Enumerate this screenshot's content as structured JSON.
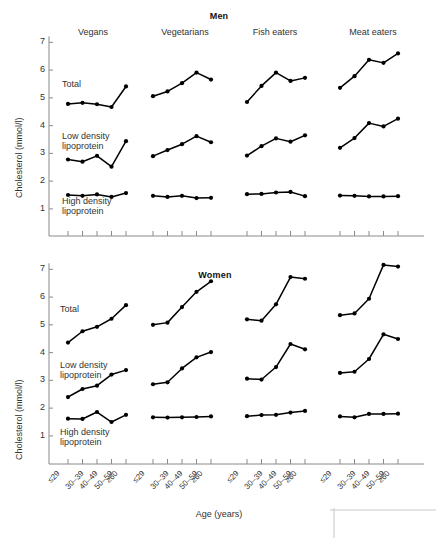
{
  "figure": {
    "ylabel": "Cholesterol (mmol/l)",
    "xlabel": "Age (years)",
    "ytick_labels": [
      "1",
      "2",
      "3",
      "4",
      "5",
      "6",
      "7"
    ],
    "age_groups": [
      "≤29",
      "30–39",
      "40–49",
      "50–59",
      "≥60"
    ],
    "diet_groups": [
      "Vegans",
      "Vegetarians",
      "Fish eaters",
      "Meat eaters"
    ],
    "series_labels": {
      "total": "Total",
      "ldl": "Low density\nlipoprotein",
      "ldl_line1": "Low density",
      "ldl_line2": "lipoprotein",
      "hdl_line1": "High density",
      "hdl_line2": "lipoprotein"
    },
    "panels": [
      "Men",
      "Women"
    ]
  },
  "chart_data": [
    {
      "type": "line",
      "title": "Men",
      "xlabel": "Age (years)",
      "ylabel": "Cholesterol (mmol/l)",
      "ylim": [
        0.6,
        7.3
      ],
      "yticks": [
        1,
        2,
        3,
        4,
        5,
        6,
        7
      ],
      "grid": false,
      "legend": "inline-labels",
      "categories": [
        "≤29",
        "30–39",
        "40–49",
        "50–59",
        "≥60"
      ],
      "groups": [
        {
          "name": "Vegans",
          "series": [
            {
              "name": "Total",
              "values": [
                4.78,
                4.82,
                4.77,
                4.67,
                5.41
              ]
            },
            {
              "name": "Low density lipoprotein",
              "values": [
                2.78,
                2.7,
                2.91,
                2.52,
                3.44
              ]
            },
            {
              "name": "High density lipoprotein",
              "values": [
                1.5,
                1.47,
                1.52,
                1.43,
                1.57
              ]
            }
          ]
        },
        {
          "name": "Vegetarians",
          "series": [
            {
              "name": "Total",
              "values": [
                5.06,
                5.23,
                5.53,
                5.91,
                5.66
              ]
            },
            {
              "name": "Low density lipoprotein",
              "values": [
                2.9,
                3.12,
                3.33,
                3.62,
                3.4
              ]
            },
            {
              "name": "High density lipoprotein",
              "values": [
                1.47,
                1.43,
                1.47,
                1.39,
                1.4
              ]
            }
          ]
        },
        {
          "name": "Fish eaters",
          "series": [
            {
              "name": "Total",
              "values": [
                4.85,
                5.43,
                5.91,
                5.61,
                5.72
              ]
            },
            {
              "name": "Low density lipoprotein",
              "values": [
                2.92,
                3.26,
                3.54,
                3.42,
                3.65
              ]
            },
            {
              "name": "High density lipoprotein",
              "values": [
                1.53,
                1.54,
                1.59,
                1.61,
                1.46
              ]
            }
          ]
        },
        {
          "name": "Meat eaters",
          "series": [
            {
              "name": "Total",
              "values": [
                5.36,
                5.78,
                6.37,
                6.26,
                6.6
              ]
            },
            {
              "name": "Low density lipoprotein",
              "values": [
                3.2,
                3.55,
                4.09,
                3.97,
                4.25
              ]
            },
            {
              "name": "High density lipoprotein",
              "values": [
                1.48,
                1.47,
                1.45,
                1.45,
                1.46
              ]
            }
          ]
        }
      ]
    },
    {
      "type": "line",
      "title": "Women",
      "xlabel": "Age (years)",
      "ylabel": "Cholesterol (mmol/l)",
      "ylim": [
        0.6,
        7.3
      ],
      "yticks": [
        1,
        2,
        3,
        4,
        5,
        6,
        7
      ],
      "grid": false,
      "legend": "inline-labels",
      "categories": [
        "≤29",
        "30–39",
        "40–49",
        "50–59",
        "≥60"
      ],
      "groups": [
        {
          "name": "Vegans",
          "series": [
            {
              "name": "Total",
              "values": [
                4.36,
                4.77,
                4.93,
                5.22,
                5.71
              ]
            },
            {
              "name": "Low density lipoprotein",
              "values": [
                2.4,
                2.69,
                2.81,
                3.21,
                3.37
              ]
            },
            {
              "name": "High density lipoprotein",
              "values": [
                1.62,
                1.61,
                1.86,
                1.5,
                1.76
              ]
            }
          ]
        },
        {
          "name": "Vegetarians",
          "series": [
            {
              "name": "Total",
              "values": [
                5.0,
                5.08,
                5.64,
                6.19,
                6.57
              ]
            },
            {
              "name": "Low density lipoprotein",
              "values": [
                2.86,
                2.93,
                3.43,
                3.83,
                4.02
              ]
            },
            {
              "name": "High density lipoprotein",
              "values": [
                1.67,
                1.66,
                1.67,
                1.68,
                1.7
              ]
            }
          ]
        },
        {
          "name": "Fish eaters",
          "series": [
            {
              "name": "Total",
              "values": [
                5.2,
                5.15,
                5.74,
                6.72,
                6.66
              ]
            },
            {
              "name": "Low density lipoprotein",
              "values": [
                3.06,
                3.03,
                3.48,
                4.31,
                4.12
              ]
            },
            {
              "name": "High density lipoprotein",
              "values": [
                1.71,
                1.75,
                1.76,
                1.84,
                1.9
              ]
            }
          ]
        },
        {
          "name": "Meat eaters",
          "series": [
            {
              "name": "Total",
              "values": [
                5.35,
                5.41,
                5.94,
                7.16,
                7.1
              ]
            },
            {
              "name": "Low density lipoprotein",
              "values": [
                3.27,
                3.31,
                3.77,
                4.66,
                4.49
              ]
            },
            {
              "name": "High density lipoprotein",
              "values": [
                1.7,
                1.67,
                1.79,
                1.79,
                1.8
              ]
            }
          ]
        }
      ]
    }
  ]
}
